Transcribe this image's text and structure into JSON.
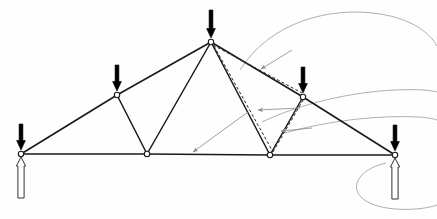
{
  "figure": {
    "title": "Statically loaded planar roof truss with point loads and support reactions",
    "type": "structural-truss-diagram",
    "background_color": "#fefefe",
    "member_color": "#1a1a1a",
    "load_arrow_color": "#000000",
    "reaction_arrow_fill": "#ffffff",
    "reaction_arrow_stroke": "#333333",
    "annotation_color": "#8c8c8c",
    "dashed_color": "#2b2b2b",
    "width": 437,
    "height": 219
  },
  "nodes": [
    {
      "id": "A",
      "name": "left-support-node",
      "x": 21,
      "y": 154,
      "marker": "open-circle"
    },
    {
      "id": "B",
      "name": "left-top-chord-node",
      "x": 117,
      "y": 95,
      "marker": "open-circle"
    },
    {
      "id": "C",
      "name": "apex-node",
      "x": 211,
      "y": 42,
      "marker": "open-circle"
    },
    {
      "id": "D",
      "name": "left-bottom-chord-node",
      "x": 147,
      "y": 154,
      "marker": "open-circle"
    },
    {
      "id": "E",
      "name": "right-bottom-chord-node",
      "x": 270,
      "y": 155,
      "marker": "open-circle"
    },
    {
      "id": "F",
      "name": "right-top-chord-node",
      "x": 303,
      "y": 97,
      "marker": "open-circle"
    },
    {
      "id": "G",
      "name": "right-support-node",
      "x": 395,
      "y": 155,
      "marker": "open-circle"
    }
  ],
  "members": [
    {
      "name": "member-A-B",
      "from": "A",
      "to": "B",
      "kind": "top-chord",
      "width": 1.6
    },
    {
      "name": "member-B-C",
      "from": "B",
      "to": "C",
      "kind": "top-chord",
      "width": 1.6
    },
    {
      "name": "member-C-F",
      "from": "C",
      "to": "F",
      "kind": "top-chord",
      "width": 1.6
    },
    {
      "name": "member-F-G",
      "from": "F",
      "to": "G",
      "kind": "top-chord",
      "width": 1.6
    },
    {
      "name": "member-A-D",
      "from": "A",
      "to": "D",
      "kind": "bottom-chord",
      "width": 1.6
    },
    {
      "name": "member-D-E",
      "from": "D",
      "to": "E",
      "kind": "bottom-chord",
      "width": 1.6
    },
    {
      "name": "member-E-G",
      "from": "E",
      "to": "G",
      "kind": "bottom-chord",
      "width": 1.6
    },
    {
      "name": "member-B-D",
      "from": "B",
      "to": "D",
      "kind": "web",
      "width": 1.5
    },
    {
      "name": "member-D-C",
      "from": "D",
      "to": "C",
      "kind": "web",
      "width": 1.5
    },
    {
      "name": "member-C-E",
      "from": "C",
      "to": "E",
      "kind": "web",
      "width": 1.5
    },
    {
      "name": "member-E-F",
      "from": "E",
      "to": "F",
      "kind": "web",
      "width": 1.5
    }
  ],
  "dashed_annotations": [
    {
      "name": "dashed-apex-to-right-top",
      "x1": 213,
      "y1": 45,
      "x2": 302,
      "y2": 93
    },
    {
      "name": "dashed-apex-to-bottom-right",
      "x1": 214,
      "y1": 46,
      "x2": 273,
      "y2": 152
    },
    {
      "name": "dashed-bottom-right-to-top",
      "x1": 273,
      "y1": 152,
      "x2": 306,
      "y2": 95
    }
  ],
  "loads": [
    {
      "name": "load-arrow-left-support",
      "x": 21,
      "tip_y": 150,
      "length": 26,
      "label": ""
    },
    {
      "name": "load-arrow-left-top",
      "x": 117,
      "tip_y": 91,
      "length": 26,
      "label": ""
    },
    {
      "name": "load-arrow-apex",
      "x": 211,
      "tip_y": 38,
      "length": 28,
      "label": ""
    },
    {
      "name": "load-arrow-right-top",
      "x": 303,
      "tip_y": 93,
      "length": 26,
      "label": ""
    },
    {
      "name": "load-arrow-right-support",
      "x": 395,
      "tip_y": 151,
      "length": 26,
      "label": ""
    }
  ],
  "reactions": [
    {
      "name": "reaction-arrow-left",
      "x": 21,
      "tip_y": 157,
      "length": 41,
      "label": ""
    },
    {
      "name": "reaction-arrow-right",
      "x": 395,
      "tip_y": 158,
      "length": 41,
      "label": ""
    }
  ],
  "leader_curves": [
    {
      "name": "leader-curve-upper-right",
      "d": "M 240 70 C 270 22 330 6 380 14 C 412 19 430 33 437 46"
    },
    {
      "name": "leader-curve-mid-right",
      "d": "M 262 122 C 300 104 350 92 395 90 C 416 89 430 90 437 92"
    },
    {
      "name": "leader-curve-lower-right",
      "d": "M 285 133 C 330 120 380 115 420 117 C 430 118 434 119 437 120"
    },
    {
      "name": "leader-curve-bottom-loop",
      "d": "M 386 163 C 356 170 348 190 366 201 C 386 213 424 210 437 205"
    }
  ],
  "leader_arrows": [
    {
      "name": "leader-arrow-to-bottom-chord",
      "x1": 248,
      "y1": 112,
      "x2": 193,
      "y2": 152
    },
    {
      "name": "leader-arrow-to-top-chord",
      "x1": 292,
      "y1": 50,
      "x2": 261,
      "y2": 69
    },
    {
      "name": "leader-arrow-to-web-upper",
      "x1": 300,
      "y1": 108,
      "x2": 258,
      "y2": 110
    },
    {
      "name": "leader-arrow-to-web-lower",
      "x1": 312,
      "y1": 128,
      "x2": 281,
      "y2": 131
    }
  ],
  "accessible_description": "Planar roof truss spanning between two pin supports. Five downward point loads act at the two supports, the two top-chord panel points and the apex. Two white upward reaction arrows are drawn beneath the left and right supports. Dashed lines and thin grey leader arrows annotate displaced member positions on the right half of the truss."
}
